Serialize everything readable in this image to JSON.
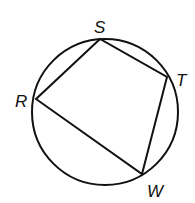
{
  "diagram": {
    "type": "inscribed-quadrilateral",
    "colors": {
      "stroke": "#111111",
      "background": "#ffffff"
    },
    "circle": {
      "cx": 105,
      "cy": 112,
      "r": 73
    },
    "vertices": [
      {
        "id": "S",
        "label": "S",
        "x": 100,
        "y": 39,
        "label_x": 94,
        "label_y": 33
      },
      {
        "id": "T",
        "label": "T",
        "x": 167,
        "y": 77,
        "label_x": 176,
        "label_y": 86
      },
      {
        "id": "W",
        "label": "W",
        "x": 142,
        "y": 174,
        "label_x": 147,
        "label_y": 197
      },
      {
        "id": "R",
        "label": "R",
        "x": 36,
        "y": 99,
        "label_x": 15,
        "label_y": 107
      }
    ],
    "edges": [
      [
        "R",
        "S"
      ],
      [
        "S",
        "T"
      ],
      [
        "T",
        "W"
      ],
      [
        "W",
        "R"
      ]
    ]
  }
}
